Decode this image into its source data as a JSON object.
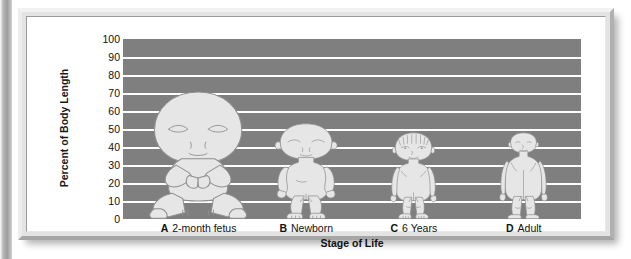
{
  "chart_data": {
    "type": "bar",
    "title": "",
    "subtitle": "",
    "xlabel": "Stage of Life",
    "ylabel": "Percent of Body Length",
    "ylim": [
      0,
      100
    ],
    "ytick_step": 10,
    "yticks": [
      "100",
      "90",
      "80",
      "70",
      "60",
      "50",
      "40",
      "30",
      "20",
      "10",
      "0"
    ],
    "grid": true,
    "legend": "none",
    "categories": [
      "2-month fetus",
      "Newborn",
      "6 Years",
      "Adult"
    ],
    "category_letters": [
      "A",
      "B",
      "C",
      "D"
    ],
    "series": [
      {
        "name": "Total body length",
        "values": [
          100,
          100,
          100,
          100
        ]
      },
      {
        "name": "Head as percent of body length",
        "values": [
          50,
          25,
          18,
          12
        ]
      }
    ],
    "annotations": [
      "Human body proportions drawn to the same total body length at four stages of life",
      "Head size decreases as a fraction of body length with age"
    ],
    "plot_background_color": "#7f7f7f",
    "gridline_color": "#ffffff",
    "figure_fill_color": "#e6e6e6"
  },
  "axes": {
    "y_title": "Percent of Body Length",
    "x_title": "Stage of Life",
    "y_tick_labels": [
      "100",
      "90",
      "80",
      "70",
      "60",
      "50",
      "40",
      "30",
      "20",
      "10",
      "0"
    ]
  },
  "x_categories": [
    {
      "letter": "A",
      "label": "2-month fetus",
      "head_percent": 50
    },
    {
      "letter": "B",
      "label": "Newborn",
      "head_percent": 25
    },
    {
      "letter": "C",
      "label": "6 Years",
      "head_percent": 18
    },
    {
      "letter": "D",
      "label": "Adult",
      "head_percent": 12
    }
  ]
}
